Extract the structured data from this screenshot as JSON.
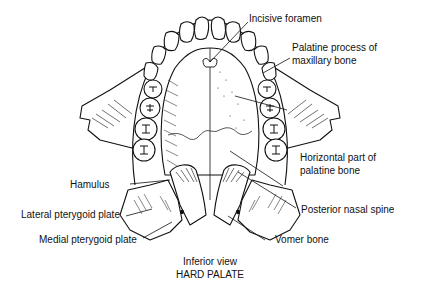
{
  "diagram": {
    "title": "HARD PALATE",
    "subtitle": "Inferior view",
    "labels": {
      "incisive_foramen": "Incisive foramen",
      "palatine_process_line1": "Palatine process of",
      "palatine_process_line2": "maxillary bone",
      "horizontal_part_line1": "Horizontal part of",
      "horizontal_part_line2": "palatine bone",
      "hamulus": "Hamulus",
      "lateral_pterygoid_plate": "Lateral pterygoid plate",
      "posterior_nasal_spine": "Posterior nasal spine",
      "medial_pterygoid_plate": "Medial pterygoid plate",
      "vomer_bone": "Vomer bone"
    },
    "colors": {
      "ink": "#111111",
      "background": "#ffffff"
    }
  }
}
